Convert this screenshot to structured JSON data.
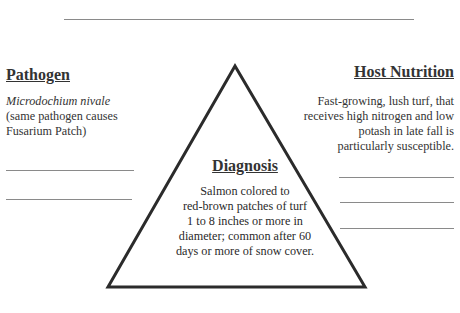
{
  "diagram": {
    "type": "disease-triangle",
    "top_rule": true,
    "pathogen": {
      "title": "Pathogen",
      "organism": "Microdochium nivale",
      "line2": "(same pathogen causes",
      "line3": "Fusarium Patch)",
      "blank_lines": 2
    },
    "host_nutrition": {
      "title": "Host Nutrition",
      "lines": [
        "Fast-growing, lush turf, that",
        "receives high nitrogen and low",
        "potash in late fall is",
        "particularly susceptible."
      ],
      "blank_lines": 3
    },
    "diagnosis": {
      "title": "Diagnosis",
      "lines": [
        "Salmon colored to",
        "red-brown patches of turf",
        "1 to 8 inches or more in",
        "diameter; common after 60",
        "days or more of snow cover."
      ]
    },
    "colors": {
      "triangle_stroke": "#2b2b2b",
      "rule": "#8a8a8a",
      "text": "#333333"
    }
  }
}
